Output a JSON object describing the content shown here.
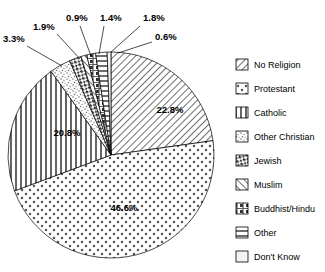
{
  "chart_data": {
    "type": "pie",
    "title": "",
    "categories": [
      "No Religion",
      "Protestant",
      "Catholic",
      "Other Christian",
      "Jewish",
      "Muslim",
      "Buddhist/Hindu",
      "Other",
      "Don't Know"
    ],
    "values": [
      22.8,
      46.6,
      20.8,
      3.3,
      1.9,
      0.9,
      1.4,
      1.8,
      0.6
    ],
    "value_labels": [
      "22.8%",
      "46.6%",
      "20.8%",
      "3.3%",
      "1.9%",
      "0.9%",
      "1.4%",
      "1.8%",
      "0.6%"
    ],
    "units": "percent",
    "xlabel": "",
    "ylabel": "",
    "legend_position": "right",
    "grid": false,
    "colors": [
      "#ffffff",
      "#ffffff",
      "#ffffff",
      "#ffffff",
      "#ffffff",
      "#ffffff",
      "#ffffff",
      "#ffffff",
      "#ffffff"
    ],
    "patterns": [
      "diagonal-hatch-down",
      "dots",
      "vertical-lines",
      "stipple",
      "dark-dash",
      "diagonal-hatch-up",
      "mixed-dark",
      "horizontal-lines",
      "blank"
    ]
  },
  "slices": {
    "inner_labels": [
      {
        "text": "22.8%",
        "x": 170,
        "y": 113
      },
      {
        "text": "46.6%",
        "x": 124,
        "y": 211
      },
      {
        "text": "20.8%",
        "x": 67,
        "y": 136
      }
    ],
    "callouts": [
      {
        "text": "3.3%",
        "x": 3,
        "y": 42
      },
      {
        "text": "1.9%",
        "x": 33,
        "y": 30
      },
      {
        "text": "0.9%",
        "x": 66,
        "y": 21
      },
      {
        "text": "1.4%",
        "x": 100,
        "y": 21
      },
      {
        "text": "1.8%",
        "x": 143,
        "y": 21
      },
      {
        "text": "0.6%",
        "x": 155,
        "y": 40
      }
    ]
  },
  "legend": {
    "items": [
      {
        "label": "No Religion",
        "pattern": "diagonal-hatch-down"
      },
      {
        "label": "Protestant",
        "pattern": "dots"
      },
      {
        "label": "Catholic",
        "pattern": "vertical-lines"
      },
      {
        "label": "Other Christian",
        "pattern": "stipple"
      },
      {
        "label": "Jewish",
        "pattern": "dark-dash"
      },
      {
        "label": "Muslim",
        "pattern": "diagonal-hatch-up"
      },
      {
        "label": "Buddhist/Hindu",
        "pattern": "mixed-dark"
      },
      {
        "label": "Other",
        "pattern": "horizontal-lines"
      },
      {
        "label": "Don't Know",
        "pattern": "blank"
      }
    ]
  }
}
